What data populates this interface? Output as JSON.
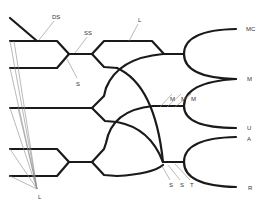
{
  "diagram": {
    "labels": {
      "ds": "DS",
      "ss": "SS",
      "s_top": "S",
      "l_top": "L",
      "l_bottom": "L",
      "mc": "MC",
      "m_right": "M",
      "u": "U",
      "a": "A",
      "r": "R",
      "m1": "M",
      "m2": "M",
      "m3": "M",
      "s1": "S",
      "s2": "S",
      "t": "T"
    },
    "colors": {
      "line": "#1a1a1a",
      "leader": "#8a8a8a",
      "text": "#333333",
      "background": "#ffffff"
    }
  }
}
